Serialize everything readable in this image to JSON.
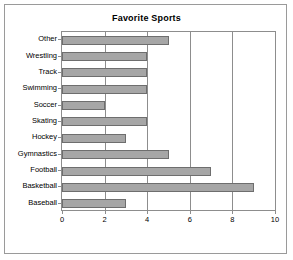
{
  "chart_data": {
    "type": "bar",
    "orientation": "horizontal",
    "title": "Favorite Sports",
    "xlabel": "",
    "ylabel": "",
    "categories": [
      "Baseball",
      "Basketball",
      "Football",
      "Gymnastics",
      "Hockey",
      "Skating",
      "Soccer",
      "Swimming",
      "Track",
      "Wrestling",
      "Other"
    ],
    "values": [
      3,
      9,
      7,
      5,
      3,
      4,
      2,
      4,
      4,
      4,
      5
    ],
    "xlim": [
      0,
      10
    ],
    "xticks": [
      0,
      2,
      4,
      6,
      8,
      10
    ],
    "xtick_labels": [
      "0",
      "2",
      "4",
      "6",
      "8",
      "10"
    ],
    "grid": true,
    "grid_axis": "x",
    "legend": null,
    "bar_color": "#a6a6a6",
    "bar_edge_color": "#6e6e6e",
    "frame_color": "#9a9a9a",
    "axis_color": "#8d8d8d",
    "background": "#ffffff"
  }
}
